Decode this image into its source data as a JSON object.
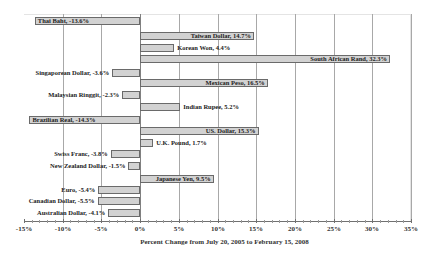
{
  "chart_data": {
    "type": "bar",
    "orientation": "horizontal",
    "title": "",
    "xlabel": "Percent Change from July 20, 2005 to February 15, 2008",
    "ylabel": "",
    "xlim": [
      -15,
      35
    ],
    "x_ticks": [
      "-15%",
      "-10%",
      "-5%",
      "0%",
      "5%",
      "10%",
      "15%",
      "20%",
      "25%",
      "30%",
      "35%"
    ],
    "grid": true,
    "legend": null,
    "categories": [
      "Thai Baht",
      "Taiwan Dollar",
      "Korean Won",
      "South African Rand",
      "Singaporean Dollar",
      "Mexican Peso",
      "Malaysian Ringgit",
      "Indian Rupee",
      "Brazilian Real",
      "US. Dollar",
      "U.K. Pound",
      "Swiss Franc",
      "New Zealand Dollar",
      "Japanese Yen",
      "Euro",
      "Canadian Dollar",
      "Australian Dollar"
    ],
    "values": [
      -13.6,
      14.7,
      4.4,
      32.3,
      -3.6,
      16.5,
      -2.3,
      5.2,
      -14.3,
      15.3,
      1.7,
      -3.8,
      -1.5,
      9.5,
      -5.4,
      -5.5,
      -4.1
    ],
    "labels": [
      "Thai Baht, -13.6%",
      "Taiwan Dollar, 14.7%",
      "Korean Won, 4.4%",
      "South African Rand, 32.3%",
      "Singaporean Dollar, -3.6%",
      "Mexican Peso, 16.5%",
      "Malaysian Ringgit, -2.3%",
      "Indian Rupee, 5.2%",
      "Brazilian Real, -14.3%",
      "US. Dollar, 15.3%",
      "U.K. Pound, 1.7%",
      "Swiss Franc, -3.8%",
      "New Zealand Dollar, -1.5%",
      "Japanese Yen, 9.5%",
      "Euro, -5.4%",
      "Canadian Dollar, -5.5%",
      "Australian Dollar, -4.1%"
    ],
    "bar_color": "#d2d2d2",
    "bar_border": "#6a6a6a"
  }
}
